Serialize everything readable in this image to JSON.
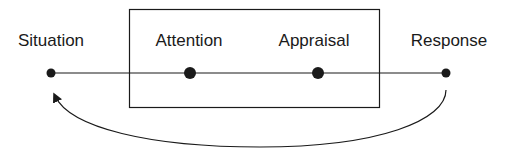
{
  "diagram": {
    "stages": [
      {
        "label": "Situation",
        "x": 51,
        "dot_r": 4.5
      },
      {
        "label": "Attention",
        "x": 190,
        "dot_r": 6
      },
      {
        "label": "Appraisal",
        "x": 318,
        "dot_r": 6
      },
      {
        "label": "Response",
        "x": 446,
        "dot_r": 4.5
      }
    ],
    "box": {
      "x": 129,
      "y": 9,
      "width": 250,
      "height": 98
    },
    "line_y": 73,
    "feedback_arrow": {
      "from": "Response",
      "to": "Situation"
    },
    "colors": {
      "stroke": "#1a1a1a",
      "background": "#ffffff"
    }
  }
}
